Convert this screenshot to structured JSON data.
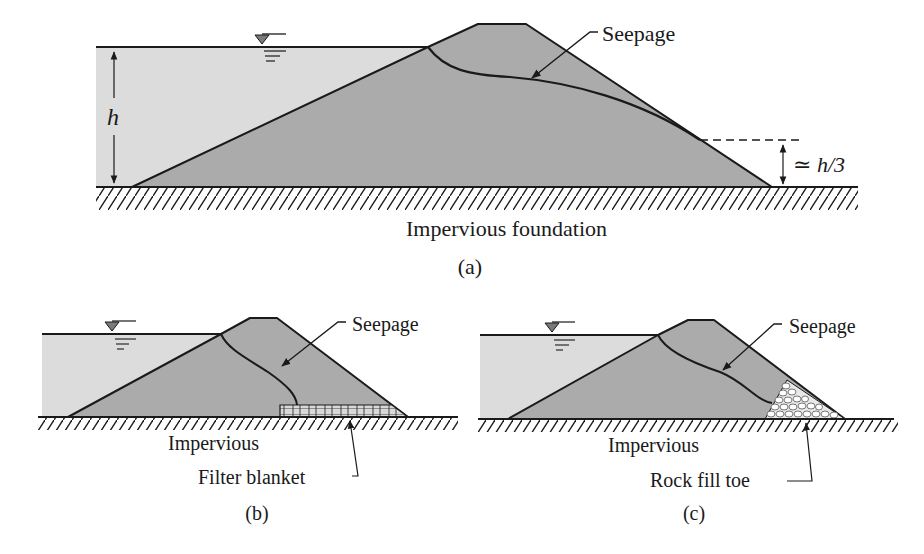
{
  "colors": {
    "water": "#dcdcdc",
    "dam": "#ababab",
    "line": "#1a1a1a",
    "background": "#ffffff"
  },
  "panels": [
    {
      "id": "a",
      "caption": "(a)",
      "seepage_label": "Seepage",
      "foundation_label": "Impervious foundation",
      "height_label": "h",
      "exit_height_label": "≃ h/3"
    },
    {
      "id": "b",
      "caption": "(b)",
      "seepage_label": "Seepage",
      "foundation_label": "Impervious",
      "drain_label": "Filter blanket"
    },
    {
      "id": "c",
      "caption": "(c)",
      "seepage_label": "Seepage",
      "foundation_label": "Impervious",
      "drain_label": "Rock fill toe"
    }
  ]
}
